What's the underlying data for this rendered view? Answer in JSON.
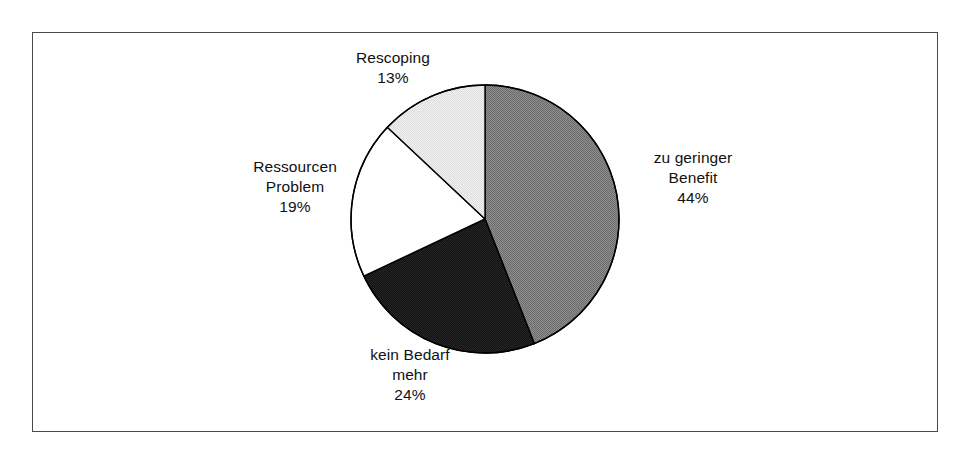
{
  "chart_data": {
    "type": "pie",
    "title": "",
    "subtitle": "",
    "xlabel": "",
    "ylabel": "",
    "legend_position": "none",
    "grid": false,
    "start_angle_deg": 0,
    "direction": "clockwise",
    "units": "%",
    "categories": [
      "zu geringer Benefit",
      "kein Bedarf mehr",
      "Ressourcen Problem",
      "Rescoping"
    ],
    "values": [
      44,
      24,
      19,
      13
    ],
    "slices": [
      {
        "id": "benefit",
        "label_lines": [
          "zu geringer",
          "Benefit"
        ],
        "label_full": "zu geringer Benefit",
        "value": 44,
        "value_text": "44%",
        "color": "#808080",
        "stroke": "#000000",
        "start_deg": 0,
        "end_deg": 158.4
      },
      {
        "id": "kein-bedarf",
        "label_lines": [
          "kein Bedarf",
          "mehr"
        ],
        "label_full": "kein Bedarf mehr",
        "value": 24,
        "value_text": "24%",
        "color": "#141414",
        "stroke": "#000000",
        "start_deg": 158.4,
        "end_deg": 244.8
      },
      {
        "id": "ressourcen",
        "label_lines": [
          "Ressourcen",
          "Problem"
        ],
        "label_full": "Ressourcen Problem",
        "value": 19,
        "value_text": "19%",
        "color": "#ffffff",
        "stroke": "#000000",
        "start_deg": 244.8,
        "end_deg": 313.2
      },
      {
        "id": "rescoping",
        "label_lines": [
          "Rescoping"
        ],
        "label_full": "Rescoping",
        "value": 13,
        "value_text": "13%",
        "color": "#e9e9e9",
        "stroke": "#000000",
        "start_deg": 313.2,
        "end_deg": 360
      }
    ],
    "geometry": {
      "center_x": 485,
      "center_y": 219,
      "radius": 134
    },
    "frame": {
      "border_color": "#4a4a4a",
      "background": "#ffffff"
    }
  },
  "labels": {
    "rescoping": {
      "line1": "Rescoping",
      "pct": "13%"
    },
    "ressourcen": {
      "line1": "Ressourcen",
      "line2": "Problem",
      "pct": "19%"
    },
    "benefit": {
      "line1": "zu geringer",
      "line2": "Benefit",
      "pct": "44%"
    },
    "kein_bedarf": {
      "line1": "kein Bedarf",
      "line2": "mehr",
      "pct": "24%"
    }
  }
}
